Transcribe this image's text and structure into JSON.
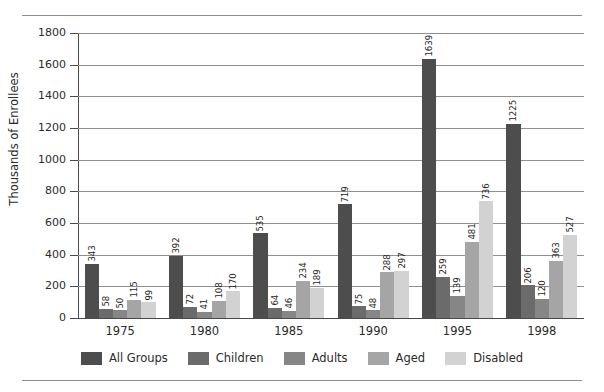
{
  "chart_data": {
    "type": "bar",
    "title": "",
    "subtitle": "",
    "xlabel": "",
    "ylabel": "Thousands of Enrollees",
    "categories": [
      "1975",
      "1980",
      "1985",
      "1990",
      "1995",
      "1998"
    ],
    "series": [
      {
        "name": "All Groups",
        "color": "#4d4d4d",
        "values": [
          343,
          392,
          535,
          719,
          1639,
          1225
        ]
      },
      {
        "name": "Children",
        "color": "#6b6b6b",
        "values": [
          58,
          72,
          64,
          75,
          259,
          206
        ]
      },
      {
        "name": "Adults",
        "color": "#868686",
        "values": [
          50,
          41,
          46,
          48,
          139,
          120
        ]
      },
      {
        "name": "Aged",
        "color": "#a5a5a5",
        "values": [
          115,
          108,
          234,
          288,
          481,
          363
        ]
      },
      {
        "name": "Disabled",
        "color": "#d2d2d2",
        "values": [
          99,
          170,
          189,
          297,
          736,
          527
        ]
      }
    ],
    "ylim": [
      0,
      1800
    ],
    "yticks": [
      0,
      200,
      400,
      600,
      800,
      1000,
      1200,
      1400,
      1600,
      1800
    ],
    "ytick_labels": [
      "0",
      "200",
      "400",
      "600",
      "800",
      "1000",
      "1200",
      "1400",
      "1600",
      "1800"
    ],
    "grid": true,
    "grid_axis": "y",
    "legend_position": "bottom",
    "show_value_labels": true,
    "value_label_rotation": -90
  },
  "legend": {
    "items": [
      {
        "label": "All Groups",
        "color": "#4d4d4d"
      },
      {
        "label": "Children",
        "color": "#6b6b6b"
      },
      {
        "label": "Adults",
        "color": "#868686"
      },
      {
        "label": "Aged",
        "color": "#a5a5a5"
      },
      {
        "label": "Disabled",
        "color": "#d2d2d2"
      }
    ]
  },
  "axes": {
    "y_title": "Thousands of Enrollees"
  },
  "style": {
    "frame_color": "#8d8d8d",
    "grid_color": "#8f8f8f",
    "axis_color": "#4a4a4a",
    "text_color": "#2b2b2b",
    "background": "#ffffff"
  }
}
